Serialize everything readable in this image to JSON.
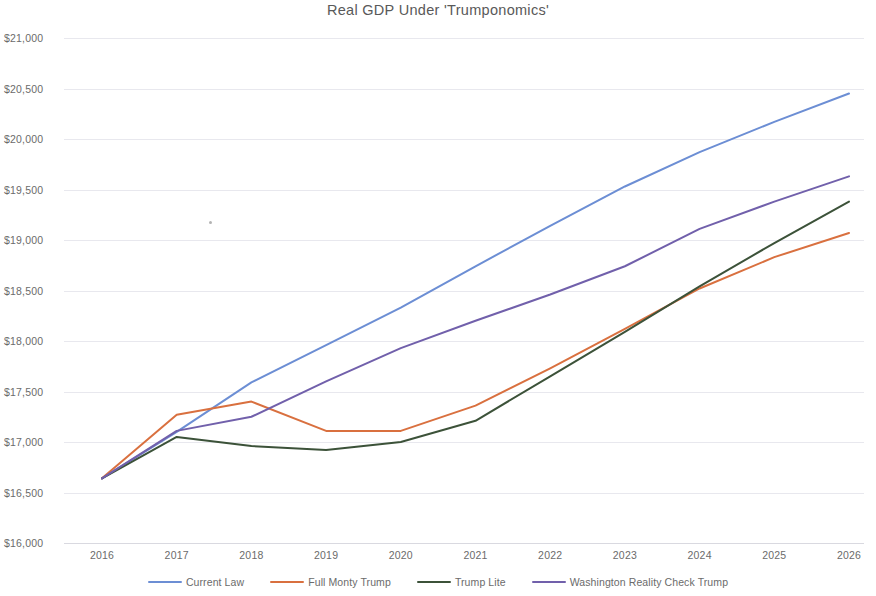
{
  "chart_data": {
    "type": "line",
    "title": "Real GDP Under 'Trumponomics'",
    "xlabel": "",
    "ylabel": "",
    "x": [
      2016,
      2017,
      2018,
      2019,
      2020,
      2021,
      2022,
      2023,
      2024,
      2025,
      2026
    ],
    "categories": [
      "2016",
      "2017",
      "2018",
      "2019",
      "2020",
      "2021",
      "2022",
      "2023",
      "2024",
      "2025",
      "2026"
    ],
    "xlim": [
      2016,
      2026
    ],
    "ylim": [
      16000,
      21000
    ],
    "ytick_values": [
      16000,
      16500,
      17000,
      17500,
      18000,
      18500,
      19000,
      19500,
      20000,
      20500,
      21000
    ],
    "ytick_labels": [
      "$16,000",
      "$16,500",
      "$17,000",
      "$17,500",
      "$18,000",
      "$18,500",
      "$19,000",
      "$19,500",
      "$20,000",
      "$20,500",
      "$21,000"
    ],
    "grid": true,
    "legend_position": "bottom",
    "series": [
      {
        "name": "Current Law",
        "color": "#6c8ed4",
        "values": [
          16640,
          17100,
          17590,
          17960,
          18330,
          18740,
          19140,
          19530,
          19870,
          20170,
          20450
        ]
      },
      {
        "name": "Full Monty Trump",
        "color": "#d9703f",
        "values": [
          16640,
          17270,
          17400,
          17110,
          17110,
          17360,
          17730,
          18120,
          18520,
          18830,
          19070
        ]
      },
      {
        "name": "Trump Lite",
        "color": "#3c5239",
        "values": [
          16640,
          17050,
          16960,
          16920,
          17000,
          17210,
          17650,
          18090,
          18540,
          18970,
          19380
        ]
      },
      {
        "name": "Washington Reality Check Trump",
        "color": "#7160ab",
        "values": [
          16640,
          17110,
          17250,
          17600,
          17930,
          18200,
          18460,
          18740,
          19110,
          19380,
          19630
        ]
      }
    ]
  },
  "legend": {
    "items": [
      {
        "label": "Current Law",
        "color": "#6c8ed4"
      },
      {
        "label": "Full Monty Trump",
        "color": "#d9703f"
      },
      {
        "label": "Trump Lite",
        "color": "#3c5239"
      },
      {
        "label": "Washington Reality Check Trump",
        "color": "#7160ab"
      }
    ]
  }
}
